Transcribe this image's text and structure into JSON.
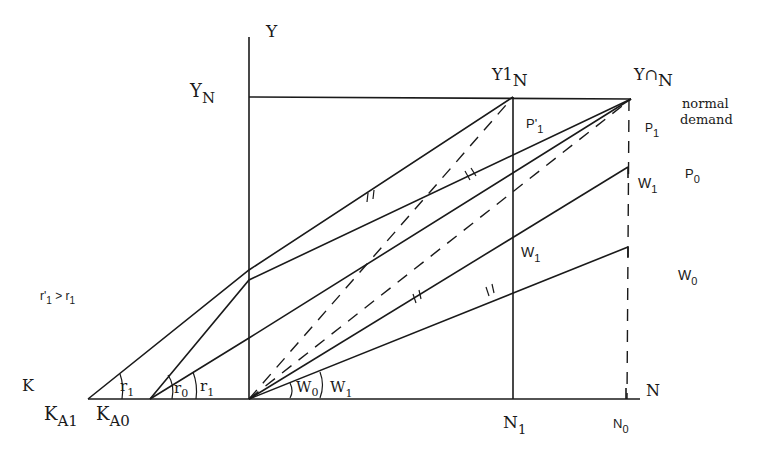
{
  "diagram": {
    "axes": {
      "y_axis_label": "Y",
      "x_axis_label": "N",
      "k_axis_label": "K"
    },
    "levels": {
      "y_n": "Y",
      "y_n_sub": "N",
      "y1_n": "Y1",
      "y1_n_sub": "N",
      "y0_n": "Y∩",
      "y0_n_sub": "N"
    },
    "annotations": {
      "normal_demand_line1": "normal",
      "normal_demand_line2": "demand",
      "condition": "r'",
      "condition_sub1": "1",
      "condition_rel": " > r",
      "condition_sub2": "1"
    },
    "price_labels": {
      "p1_prime": "P'",
      "p1_prime_sub": "1",
      "p1": "P",
      "p1_sub": "1",
      "p0": "P",
      "p0_sub": "0"
    },
    "wage_labels": {
      "w1_right": "W",
      "w1_right_sub": "1",
      "w1_mid": "W",
      "w1_mid_sub": "1",
      "w0_right": "W",
      "w0_right_sub": "0",
      "w0_angle": "W",
      "w0_angle_sub": "0",
      "w1_angle": "W",
      "w1_angle_sub": "1"
    },
    "rate_labels": {
      "r1_left": "r",
      "r1_left_sub": "1",
      "r0_angle": "r",
      "r0_angle_sub": "0",
      "r1_angle": "r",
      "r1_angle_sub": "1"
    },
    "k_points": {
      "ka1": "K",
      "ka1_sub": "A1",
      "ka0": "K",
      "ka0_sub": "A0"
    },
    "n_points": {
      "n1": "N",
      "n1_sub": "1",
      "n0": "N",
      "n0_sub": "0"
    }
  }
}
